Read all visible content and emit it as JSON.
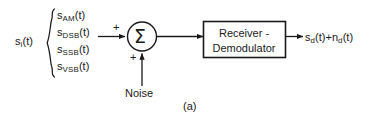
{
  "figure": {
    "caption": "(a)",
    "input_label": "s",
    "input_label_sub": "i",
    "input_label_arg": "(t)",
    "signals": [
      {
        "base": "s",
        "sub": "AM",
        "arg": "(t)"
      },
      {
        "base": "s",
        "sub": "DSB",
        "arg": "(t)"
      },
      {
        "base": "s",
        "sub": "SSB",
        "arg": "(t)"
      },
      {
        "base": "s",
        "sub": "VSB",
        "arg": "(t)"
      }
    ],
    "summer": {
      "symbol": "Σ",
      "signal_input_sign": "+",
      "noise_input_sign": "+"
    },
    "block": {
      "line_0": "Receiver -",
      "line_1": "Demodulator"
    },
    "noise_label": "Noise",
    "output": {
      "signal_base": "s",
      "signal_sub": "d",
      "signal_arg": "(t)",
      "operator": "+",
      "noise_base": "n",
      "noise_sub": "d",
      "noise_arg": "(t)"
    },
    "colors": {
      "ink": "#1a1a1a",
      "background": "#ffffff"
    }
  }
}
